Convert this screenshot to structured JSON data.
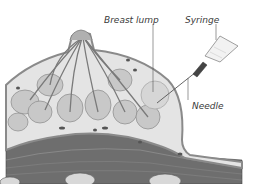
{
  "figure": {
    "labels": {
      "breast_lump": "Breast lump",
      "syringe": "Syringe",
      "needle": "Needle"
    },
    "colors": {
      "background": "#ffffff",
      "skin": "#9a9a9a",
      "fat": "#e4e4e4",
      "lobule": "#c8c8c8",
      "duct": "#7a7a7a",
      "muscle": "#6e6e6e",
      "bone": "#d8d8d8",
      "text": "#3a3a3a"
    }
  }
}
